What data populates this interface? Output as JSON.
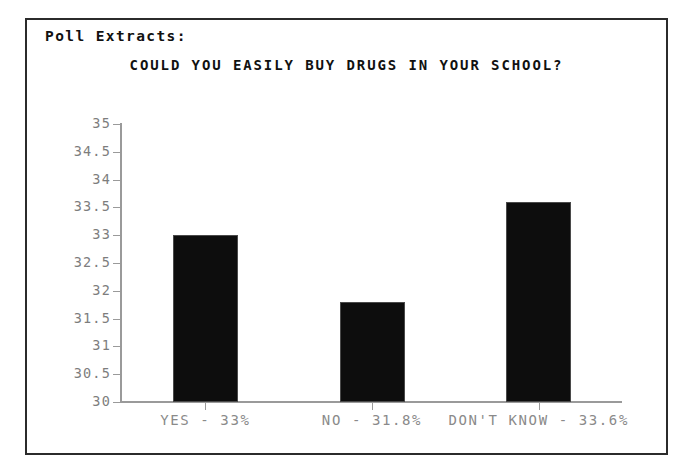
{
  "page": {
    "caption": "Poll Extracts:"
  },
  "chart_data": {
    "type": "bar",
    "title": "COULD YOU EASILY BUY DRUGS IN YOUR SCHOOL?",
    "xlabel": "",
    "ylabel": "",
    "categories": [
      "YES - 33%",
      "NO - 31.8%",
      "DON'T KNOW - 33.6%"
    ],
    "values": [
      33.0,
      31.8,
      33.6
    ],
    "ylim": [
      30,
      35
    ],
    "ytick_step": 0.5,
    "ytick_labels": [
      "35",
      "34.5",
      "34",
      "33.5",
      "33",
      "32.5",
      "32",
      "31.5",
      "31",
      "30.5",
      "30"
    ],
    "grid": false,
    "legend": false,
    "bar_color": "#0d0d0d",
    "axis_color": "#9a9a9a",
    "label_color": "#8a8a8a",
    "title_color": "#111111"
  }
}
